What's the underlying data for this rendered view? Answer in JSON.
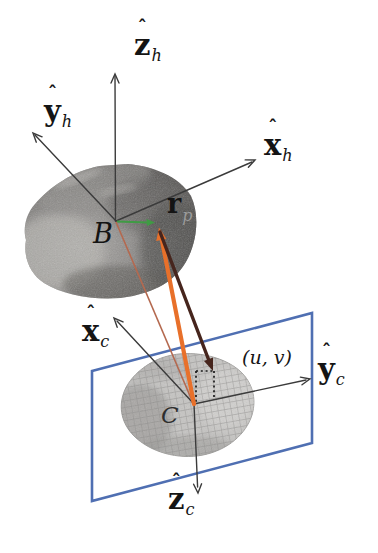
{
  "figure": {
    "axis_labels": {
      "z_h": {
        "hat": "ˆ",
        "base": "z",
        "sub": "h"
      },
      "y_h": {
        "hat": "ˆ",
        "base": "y",
        "sub": "h"
      },
      "x_h": {
        "hat": "ˆ",
        "base": "x",
        "sub": "h"
      },
      "x_c": {
        "hat": "ˆ",
        "base": "x",
        "sub": "c"
      },
      "y_c": {
        "hat": "ˆ",
        "base": "y",
        "sub": "c"
      },
      "z_c": {
        "hat": "ˆ",
        "base": "z",
        "sub": "c"
      }
    },
    "point_labels": {
      "body_center": "B",
      "camera_center": "C",
      "pixel": "(u, v)"
    },
    "vector_labels": {
      "r_base": "r",
      "r_sub": "p"
    },
    "colors": {
      "plane_border": "#4f6fb2",
      "axis_line": "#3b3b3b",
      "vector_rp_green": "#3f9b44",
      "los_orange": "#e8702a",
      "pixel_vector_maroon": "#46251d",
      "b_to_c_line": "#b4694f",
      "dotted_projection": "#1a1a1a"
    }
  }
}
